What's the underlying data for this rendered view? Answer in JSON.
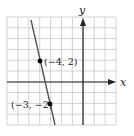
{
  "chart_data": {
    "type": "line",
    "title": "",
    "xlabel": "x",
    "ylabel": "y",
    "xlim": [
      -7,
      3
    ],
    "ylim": [
      -4,
      6
    ],
    "grid": true,
    "series": [
      {
        "name": "line",
        "x": [
          -4.8,
          -2.6
        ],
        "y": [
          5.7,
          -4.0
        ],
        "color": "#555555"
      }
    ],
    "points": [
      {
        "x": -4,
        "y": 2,
        "label": "(−4, 2)"
      },
      {
        "x": -3,
        "y": -2,
        "label": "(−3, −2)"
      }
    ],
    "annotations": [
      "(−4, 2)",
      "(−3, −2)"
    ]
  },
  "labels": {
    "x_axis": "x",
    "y_axis": "y",
    "point_a": "(−4, 2)",
    "point_b": "(−3, −2)"
  },
  "colors": {
    "grid": "#c8c8c8",
    "axis": "#222222",
    "line": "#555555",
    "point": "#000000"
  }
}
